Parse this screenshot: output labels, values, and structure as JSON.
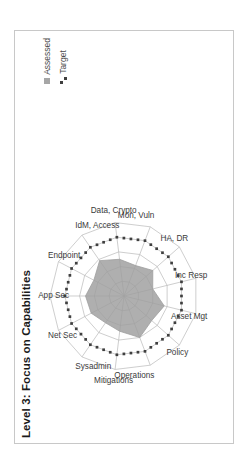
{
  "chart_frame": {
    "border_color": "#c8c8c8"
  },
  "title": "Level 3: Focus on Capabilities",
  "legend": {
    "position": "top-right",
    "items": [
      {
        "label": "Assessed",
        "marker": "filled-square",
        "color": "#a6a6a6"
      },
      {
        "label": "Target",
        "marker": "dotted-line",
        "color": "#3f3f3f"
      }
    ]
  },
  "chart_data": {
    "type": "radar",
    "title": "Level 3: Focus on Capabilities",
    "xlabel": "",
    "ylabel": "",
    "grid": true,
    "rings": 5,
    "rlim": [
      0,
      5
    ],
    "legend_position": "top-right",
    "categories": [
      "App Sec",
      "Endpoint",
      "IdM, Access",
      "Data, Crypto",
      "Mon, Vuln",
      "HA, DR",
      "Inc Resp",
      "Asset Mgt",
      "Policy",
      "Operations",
      "Mitigations",
      "Sysadmin",
      "Net Sec"
    ],
    "series": [
      {
        "name": "Assessed",
        "color": "#9e9e9e",
        "fill": true,
        "values": [
          2.6,
          2.3,
          2.9,
          2.5,
          2.2,
          2.6,
          2.0,
          2.8,
          2.5,
          3.0,
          2.4,
          2.2,
          2.5
        ]
      },
      {
        "name": "Target",
        "color": "#3f3f3f",
        "fill": false,
        "style": "dotted",
        "values": [
          4.0,
          4.0,
          4.0,
          4.0,
          4.0,
          4.0,
          4.0,
          4.0,
          4.0,
          4.0,
          4.0,
          4.0,
          4.0
        ]
      }
    ]
  }
}
